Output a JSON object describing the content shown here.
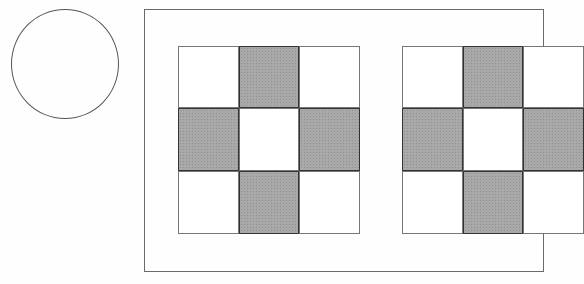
{
  "diagram": {
    "circle": {
      "label": "",
      "fill": "#ffffff",
      "stroke": "#555555"
    },
    "frame": {
      "label": "",
      "stroke": "#6a6a6a"
    },
    "shade_color": "#a9a9a9",
    "grids": [
      {
        "name": "grid-1",
        "pattern": [
          [
            0,
            1,
            0
          ],
          [
            1,
            0,
            1
          ],
          [
            0,
            1,
            0
          ]
        ]
      },
      {
        "name": "grid-2",
        "pattern": [
          [
            0,
            1,
            0
          ],
          [
            1,
            0,
            1
          ],
          [
            0,
            1,
            0
          ]
        ]
      }
    ]
  }
}
